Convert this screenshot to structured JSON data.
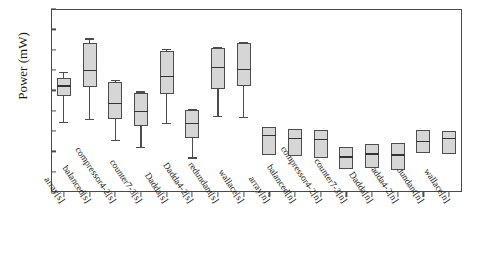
{
  "chart_data": {
    "type": "box",
    "title": "",
    "xlabel": "",
    "ylabel": "Power (mW)",
    "ylim": [
      0.8,
      2.6
    ],
    "ytick_step": 0.2,
    "yticks": [
      "2.6",
      "2.4",
      "2.2",
      "2.0",
      "1.8",
      "1.6",
      "1.4",
      "1.2",
      "1.0",
      "0.8"
    ],
    "grid": false,
    "legend": "none",
    "categories": [
      "array[s]",
      "balanced[s]",
      "compressor4-2[s]",
      "counter7-3[s]",
      "Dadda[s]",
      "Dadda4-2[s]",
      "redundant[s]",
      "wallace[s]",
      "array[n]",
      "balanced[n]",
      "compressor4-2[n]",
      "counter7-3[n]",
      "Dadda[n]",
      "Dadda4-2[n]",
      "redundant[n]",
      "wallace[n]"
    ],
    "boxes": [
      {
        "label": "array[s]",
        "min": 1.49,
        "q1": 1.74,
        "median": 1.85,
        "q3": 1.92,
        "max": 1.98
      },
      {
        "label": "balanced[s]",
        "min": 1.52,
        "q1": 1.83,
        "median": 2.0,
        "q3": 2.27,
        "max": 2.31
      },
      {
        "label": "compressor4-2[s]",
        "min": 1.31,
        "q1": 1.52,
        "median": 1.68,
        "q3": 1.88,
        "max": 1.9
      },
      {
        "label": "counter7-3[s]",
        "min": 1.24,
        "q1": 1.45,
        "median": 1.6,
        "q3": 1.77,
        "max": 1.79
      },
      {
        "label": "Dadda[s]",
        "min": 1.48,
        "q1": 1.76,
        "median": 1.94,
        "q3": 2.19,
        "max": 2.21
      },
      {
        "label": "Dadda4-2[s]",
        "min": 1.14,
        "q1": 1.33,
        "median": 1.48,
        "q3": 1.61,
        "max": 1.62
      },
      {
        "label": "redundant[s]",
        "min": 1.55,
        "q1": 1.81,
        "median": 2.03,
        "q3": 2.22,
        "max": 2.23
      },
      {
        "label": "wallace[s]",
        "min": 1.54,
        "q1": 1.84,
        "median": 2.01,
        "q3": 2.27,
        "max": 2.28
      },
      {
        "label": "array[n]",
        "min": 1.16,
        "q1": 1.16,
        "median": 1.36,
        "q3": 1.44,
        "max": 1.44
      },
      {
        "label": "balanced[n]",
        "min": 1.15,
        "q1": 1.15,
        "median": 1.33,
        "q3": 1.42,
        "max": 1.42
      },
      {
        "label": "compressor4-2[n]",
        "min": 1.13,
        "q1": 1.13,
        "median": 1.32,
        "q3": 1.41,
        "max": 1.41
      },
      {
        "label": "counter7-3[n]",
        "min": 1.03,
        "q1": 1.03,
        "median": 1.15,
        "q3": 1.24,
        "max": 1.24
      },
      {
        "label": "Dadda[n]",
        "min": 1.04,
        "q1": 1.04,
        "median": 1.18,
        "q3": 1.27,
        "max": 1.27
      },
      {
        "label": "Dadda4-2[n]",
        "min": 1.02,
        "q1": 1.02,
        "median": 1.17,
        "q3": 1.28,
        "max": 1.28
      },
      {
        "label": "redundant[n]",
        "min": 1.18,
        "q1": 1.18,
        "median": 1.3,
        "q3": 1.41,
        "max": 1.41
      },
      {
        "label": "wallace[n]",
        "min": 1.17,
        "q1": 1.17,
        "median": 1.33,
        "q3": 1.4,
        "max": 1.4
      }
    ]
  }
}
